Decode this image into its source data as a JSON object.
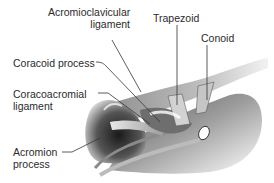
{
  "diagram": {
    "labels": [
      {
        "id": "acromioclavicular",
        "line1": "Acromioclavicular",
        "line2": "ligament"
      },
      {
        "id": "trapezoid",
        "line1": "Trapezoid"
      },
      {
        "id": "conoid",
        "line1": "Conoid"
      },
      {
        "id": "coracoid",
        "line1": "Coracoid process"
      },
      {
        "id": "coracoacromial",
        "line1": "Coracoacromial",
        "line2": "ligament"
      },
      {
        "id": "acromion",
        "line1": "Acromion",
        "line2": "process"
      }
    ],
    "colors": {
      "background": "#ffffff",
      "text": "#2b2b2b",
      "leader": "#333333",
      "bone_dark": "#1a1a1a",
      "bone_mid": "#7a7a7a",
      "bone_light": "#d6d6d6"
    }
  }
}
